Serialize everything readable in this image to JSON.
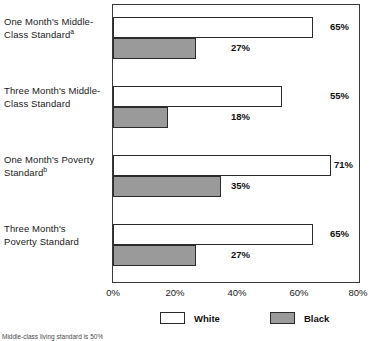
{
  "chart_data": {
    "type": "bar",
    "orientation": "horizontal",
    "title": "",
    "xlabel": "",
    "ylabel": "",
    "xlim": [
      0,
      80
    ],
    "xticks": [
      "0%",
      "20%",
      "40%",
      "60%",
      "80%"
    ],
    "xtick_values": [
      0,
      20,
      40,
      60,
      80
    ],
    "grid": false,
    "legend_position": "bottom",
    "categories": [
      "One Month's Middle-Class Standard",
      "Three Month's Middle-Class Standard",
      "One Month's Poverty Standard",
      "Three Month's Poverty Standard"
    ],
    "category_lines": [
      [
        "One Month's Middle-",
        "Class Standard"
      ],
      [
        "Three Month's Middle-",
        "Class Standard"
      ],
      [
        "One Month's Poverty",
        "Standard"
      ],
      [
        "Three Month's",
        "Poverty Standard"
      ]
    ],
    "category_footnote_marks": [
      "a",
      "",
      "b",
      ""
    ],
    "series": [
      {
        "name": "White",
        "color": "#ffffff",
        "values": [
          65,
          55,
          71,
          65
        ],
        "labels": [
          "65%",
          "55%",
          "71%",
          "65%"
        ]
      },
      {
        "name": "Black",
        "color": "#9a9a9a",
        "values": [
          27,
          18,
          35,
          27
        ],
        "labels": [
          "27%",
          "18%",
          "35%",
          "27%"
        ]
      }
    ]
  },
  "legend": {
    "items": [
      {
        "label": "White",
        "swatch": "white"
      },
      {
        "label": "Black",
        "swatch": "black"
      }
    ]
  },
  "footnote": {
    "text": "Middle-class living standard is 50%"
  },
  "colors": {
    "bar_white_fill": "#ffffff",
    "bar_black_fill": "#9a9a9a",
    "bar_border": "#2b2b2b",
    "frame": "#3a3a3a",
    "text": "#1a1a1a"
  }
}
